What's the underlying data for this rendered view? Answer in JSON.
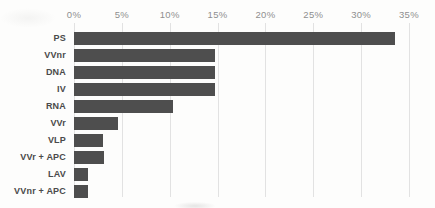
{
  "chart_data": {
    "type": "bar",
    "orientation": "horizontal",
    "title": "",
    "xlabel": "",
    "ylabel": "",
    "axis_position": "top",
    "grid": "vertical",
    "xlim": [
      0,
      35
    ],
    "x_ticks": [
      {
        "value": 0,
        "label": "0%"
      },
      {
        "value": 5,
        "label": "5%"
      },
      {
        "value": 10,
        "label": "10%"
      },
      {
        "value": 15,
        "label": "15%"
      },
      {
        "value": 20,
        "label": "20%"
      },
      {
        "value": 25,
        "label": "25%"
      },
      {
        "value": 30,
        "label": "30%"
      },
      {
        "value": 35,
        "label": "35%"
      }
    ],
    "categories": [
      "PS",
      "VVnr",
      "DNA",
      "IV",
      "RNA",
      "VVr",
      "VLP",
      "VVr + APC",
      "LAV",
      "VVnr + APC"
    ],
    "values": [
      33.5,
      14.7,
      14.7,
      14.7,
      10.3,
      4.6,
      3.0,
      3.1,
      1.5,
      1.5
    ],
    "unit": "%",
    "colors": {
      "bar": "#4e4e4e",
      "category_label": "#4a4a4a",
      "tick_label": "#8f8f8f",
      "gridline": "#e2e2e2",
      "background": "#fdfdfc"
    }
  }
}
